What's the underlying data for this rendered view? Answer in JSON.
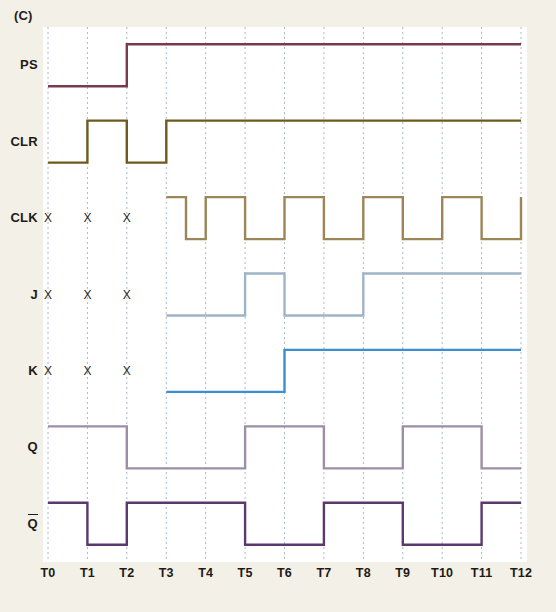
{
  "figure": {
    "panel_label": "(C)",
    "background_color": "#f3f0e7",
    "plot_background": "#ffffff"
  },
  "chart_data": {
    "type": "line",
    "title": "(C)",
    "xlabel": "",
    "ylabel": "",
    "grid": true,
    "legend_position": "left-axis-labels",
    "x_tick_labels": [
      "T0",
      "T1",
      "T2",
      "T3",
      "T4",
      "T5",
      "T6",
      "T7",
      "T8",
      "T9",
      "T10",
      "T11",
      "T12"
    ],
    "x_ticks": [
      0,
      1,
      2,
      3,
      4,
      5,
      6,
      7,
      8,
      9,
      10,
      11,
      12
    ],
    "xlim": [
      0,
      12
    ],
    "grid_color": "#a9b8c9",
    "series": [
      {
        "name": "PS",
        "label": "PS",
        "color": "#7a3a4e",
        "undefined_marks": [],
        "start": 0,
        "end": 12,
        "levels": [
          {
            "from": 0,
            "to": 2,
            "value": 0
          },
          {
            "from": 2,
            "to": 12,
            "value": 1
          }
        ]
      },
      {
        "name": "CLR",
        "label": "CLR",
        "color": "#6e5a1e",
        "undefined_marks": [],
        "start": 0,
        "end": 12,
        "levels": [
          {
            "from": 0,
            "to": 1,
            "value": 0
          },
          {
            "from": 1,
            "to": 2,
            "value": 1
          },
          {
            "from": 2,
            "to": 3,
            "value": 0
          },
          {
            "from": 3,
            "to": 12,
            "value": 1
          }
        ]
      },
      {
        "name": "CLK",
        "label": "CLK",
        "color": "#9c8557",
        "undefined_marks": [
          0,
          1,
          2
        ],
        "start": 3,
        "end": 12,
        "levels": [
          {
            "from": 3,
            "to": 3.5,
            "value": 1
          },
          {
            "from": 3.5,
            "to": 4,
            "value": 0
          },
          {
            "from": 4,
            "to": 5,
            "value": 1
          },
          {
            "from": 5,
            "to": 6,
            "value": 0
          },
          {
            "from": 6,
            "to": 7,
            "value": 1
          },
          {
            "from": 7,
            "to": 8,
            "value": 0
          },
          {
            "from": 8,
            "to": 9,
            "value": 1
          },
          {
            "from": 9,
            "to": 10,
            "value": 0
          },
          {
            "from": 10,
            "to": 11,
            "value": 1
          },
          {
            "from": 11,
            "to": 12,
            "value": 0
          },
          {
            "from": 12,
            "to": 12,
            "value": 1
          }
        ]
      },
      {
        "name": "J",
        "label": "J",
        "color": "#9fb4c6",
        "undefined_marks": [
          0,
          1,
          2
        ],
        "start": 3,
        "end": 12,
        "levels": [
          {
            "from": 3,
            "to": 5,
            "value": 0
          },
          {
            "from": 5,
            "to": 6,
            "value": 1
          },
          {
            "from": 6,
            "to": 8,
            "value": 0
          },
          {
            "from": 8,
            "to": 12,
            "value": 1
          }
        ]
      },
      {
        "name": "K",
        "label": "K",
        "color": "#3d8ed1",
        "undefined_marks": [
          0,
          1,
          2
        ],
        "start": 3,
        "end": 12,
        "levels": [
          {
            "from": 3,
            "to": 6,
            "value": 0
          },
          {
            "from": 6,
            "to": 12,
            "value": 1
          }
        ]
      },
      {
        "name": "Q",
        "label": "Q",
        "color": "#9c8fa5",
        "undefined_marks": [],
        "start": 0,
        "end": 12,
        "levels": [
          {
            "from": 0,
            "to": 2,
            "value": 1
          },
          {
            "from": 2,
            "to": 5,
            "value": 0
          },
          {
            "from": 5,
            "to": 7,
            "value": 1
          },
          {
            "from": 7,
            "to": 9,
            "value": 0
          },
          {
            "from": 9,
            "to": 11,
            "value": 1
          },
          {
            "from": 11,
            "to": 12,
            "value": 0
          }
        ]
      },
      {
        "name": "Qbar",
        "label": "Q",
        "overline": true,
        "color": "#5a3a6e",
        "undefined_marks": [],
        "start": 0,
        "end": 12,
        "levels": [
          {
            "from": 0,
            "to": 1,
            "value": 1
          },
          {
            "from": 1,
            "to": 2,
            "value": 0
          },
          {
            "from": 2,
            "to": 5,
            "value": 1
          },
          {
            "from": 5,
            "to": 7,
            "value": 0
          },
          {
            "from": 7,
            "to": 9,
            "value": 1
          },
          {
            "from": 9,
            "to": 11,
            "value": 0
          },
          {
            "from": 11,
            "to": 12,
            "value": 1
          }
        ]
      }
    ],
    "undefined_symbol": "X"
  }
}
